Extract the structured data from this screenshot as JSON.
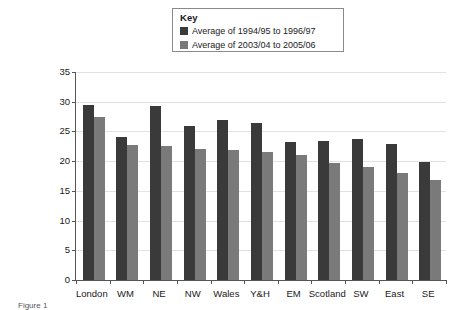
{
  "legend": {
    "title": "Key",
    "entries": [
      {
        "label": "Average of 1994/95 to 1996/97",
        "color": "#3a3a3a"
      },
      {
        "label": "Average of 2003/04 to 2005/06",
        "color": "#7a7a7a"
      }
    ]
  },
  "caption": {
    "stub": "Figure 1"
  },
  "chart_data": {
    "type": "bar",
    "title": "",
    "xlabel": "",
    "ylabel": "Percentage of the population in households below 60% of median income after deducting housing costs",
    "ylim": [
      0,
      35
    ],
    "yticks": [
      0,
      5,
      10,
      15,
      20,
      25,
      30,
      35
    ],
    "ytick_labels": [
      "0",
      "5",
      "10",
      "15",
      "20",
      "25",
      "30",
      "35"
    ],
    "grid": true,
    "legend_position": "top-center",
    "categories": [
      "London",
      "WM",
      "NE",
      "NW",
      "Wales",
      "Y&H",
      "EM",
      "Scotland",
      "SW",
      "East",
      "SE"
    ],
    "series": [
      {
        "name": "Average of 1994/95 to 1996/97",
        "color": "#3a3a3a",
        "values": [
          29.5,
          24.0,
          29.3,
          25.9,
          27.0,
          26.4,
          23.2,
          23.4,
          23.7,
          22.9,
          19.9
        ]
      },
      {
        "name": "Average of 2003/04 to 2005/06",
        "color": "#7a7a7a",
        "values": [
          27.4,
          22.8,
          22.5,
          22.0,
          21.9,
          21.5,
          21.0,
          19.7,
          19.0,
          18.0,
          16.8
        ]
      }
    ]
  }
}
